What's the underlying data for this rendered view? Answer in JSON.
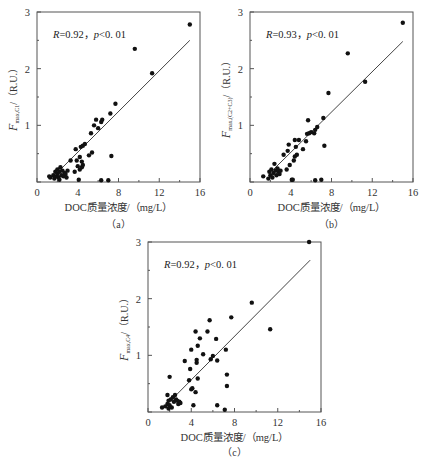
{
  "chart_data": [
    {
      "type": "scatter",
      "panel": "a",
      "caption": "（a）",
      "title": "",
      "annotation": {
        "R": "R=0.92，",
        "p": "p<0. 01"
      },
      "xlabel": "DOC质量浓度/（mg/L）",
      "ylabel": {
        "main": "F",
        "sub": "max,C1",
        "unit": "/（R.U.）"
      },
      "xlim": [
        0,
        16
      ],
      "ylim": [
        0,
        3
      ],
      "xticks": [
        0,
        4,
        8,
        12,
        16
      ],
      "yticks": [
        1,
        2,
        3
      ],
      "fit_line": {
        "x": [
          2.3,
          15.0
        ],
        "y": [
          0.22,
          2.5
        ]
      },
      "points": [
        [
          1.2,
          0.1
        ],
        [
          1.3,
          0.08
        ],
        [
          1.6,
          0.12
        ],
        [
          1.7,
          0.06
        ],
        [
          1.8,
          0.18
        ],
        [
          1.9,
          0.1
        ],
        [
          2.0,
          0.22
        ],
        [
          2.0,
          0.14
        ],
        [
          2.1,
          0.08
        ],
        [
          2.2,
          0.18
        ],
        [
          2.2,
          0.04
        ],
        [
          2.3,
          0.26
        ],
        [
          2.4,
          0.12
        ],
        [
          2.5,
          0.2
        ],
        [
          2.6,
          0.1
        ],
        [
          2.7,
          0.16
        ],
        [
          2.8,
          0.14
        ],
        [
          2.9,
          0.08
        ],
        [
          3.0,
          0.2
        ],
        [
          3.3,
          0.38
        ],
        [
          3.7,
          0.18
        ],
        [
          3.8,
          0.58
        ],
        [
          3.9,
          0.38
        ],
        [
          4.0,
          0.28
        ],
        [
          4.1,
          0.04
        ],
        [
          4.2,
          0.22
        ],
        [
          4.2,
          0.44
        ],
        [
          4.3,
          0.62
        ],
        [
          4.4,
          0.36
        ],
        [
          4.4,
          0.26
        ],
        [
          4.5,
          0.3
        ],
        [
          4.5,
          0.64
        ],
        [
          4.7,
          0.67
        ],
        [
          5.1,
          0.47
        ],
        [
          5.3,
          0.86
        ],
        [
          5.4,
          0.52
        ],
        [
          5.6,
          1.0
        ],
        [
          5.8,
          1.1
        ],
        [
          6.0,
          0.95
        ],
        [
          6.3,
          1.06
        ],
        [
          6.4,
          1.1
        ],
        [
          6.3,
          0.03
        ],
        [
          7.0,
          0.03
        ],
        [
          7.2,
          1.21
        ],
        [
          7.3,
          0.46
        ],
        [
          7.7,
          1.38
        ],
        [
          9.6,
          2.35
        ],
        [
          11.3,
          1.92
        ],
        [
          15.0,
          2.78
        ]
      ]
    },
    {
      "type": "scatter",
      "panel": "b",
      "caption": "（b）",
      "title": "",
      "annotation": {
        "R": "R=0.93，",
        "p": "p<0. 01"
      },
      "xlabel": "DOC质量浓度/（mg/L）",
      "ylabel": {
        "main": "F",
        "sub": "max,(C2+C3)",
        "unit": "/（R.U.）"
      },
      "xlim": [
        0,
        16
      ],
      "ylim": [
        0,
        3
      ],
      "xticks": [
        0,
        4,
        8,
        12,
        16
      ],
      "yticks": [
        1,
        2,
        3
      ],
      "fit_line": {
        "x": [
          2.3,
          15.0
        ],
        "y": [
          0.22,
          2.48
        ]
      },
      "points": [
        [
          1.3,
          0.1
        ],
        [
          1.8,
          0.06
        ],
        [
          1.9,
          0.18
        ],
        [
          2.0,
          0.12
        ],
        [
          2.1,
          0.22
        ],
        [
          2.2,
          0.08
        ],
        [
          2.3,
          0.16
        ],
        [
          2.4,
          0.32
        ],
        [
          2.5,
          0.2
        ],
        [
          2.6,
          0.12
        ],
        [
          2.7,
          0.24
        ],
        [
          2.8,
          0.18
        ],
        [
          2.9,
          0.14
        ],
        [
          3.0,
          0.2
        ],
        [
          3.3,
          0.48
        ],
        [
          3.6,
          0.22
        ],
        [
          3.7,
          0.55
        ],
        [
          3.8,
          0.66
        ],
        [
          3.9,
          0.3
        ],
        [
          4.1,
          0.04
        ],
        [
          4.2,
          0.04
        ],
        [
          4.3,
          0.38
        ],
        [
          4.4,
          0.45
        ],
        [
          4.4,
          0.74
        ],
        [
          4.5,
          0.62
        ],
        [
          4.6,
          0.48
        ],
        [
          4.8,
          0.74
        ],
        [
          5.2,
          0.58
        ],
        [
          5.5,
          0.72
        ],
        [
          5.6,
          0.85
        ],
        [
          5.7,
          1.09
        ],
        [
          5.8,
          0.86
        ],
        [
          6.0,
          0.88
        ],
        [
          6.3,
          0.86
        ],
        [
          6.4,
          0.92
        ],
        [
          6.6,
          0.97
        ],
        [
          6.4,
          0.03
        ],
        [
          7.0,
          0.04
        ],
        [
          7.2,
          1.13
        ],
        [
          7.3,
          0.64
        ],
        [
          7.7,
          1.57
        ],
        [
          9.6,
          2.27
        ],
        [
          11.3,
          1.77
        ],
        [
          15.0,
          2.81
        ]
      ]
    },
    {
      "type": "scatter",
      "panel": "c",
      "caption": "（c）",
      "title": "",
      "annotation": {
        "R": "R=0.92，",
        "p": "p<0. 01"
      },
      "xlabel": "DOC质量浓度/（mg/L）",
      "ylabel": {
        "main": "F",
        "sub": "max,C4",
        "unit": "/（R.U.）"
      },
      "xlim": [
        0,
        16
      ],
      "ylim": [
        0,
        3
      ],
      "xticks": [
        0,
        4,
        8,
        12,
        16
      ],
      "yticks": [
        1,
        2,
        3
      ],
      "fit_line": {
        "x": [
          2.3,
          15.0
        ],
        "y": [
          0.24,
          2.68
        ]
      },
      "points": [
        [
          1.3,
          0.08
        ],
        [
          1.6,
          0.1
        ],
        [
          1.8,
          0.3
        ],
        [
          1.8,
          0.14
        ],
        [
          1.9,
          0.06
        ],
        [
          1.9,
          0.2
        ],
        [
          2.0,
          0.62
        ],
        [
          2.0,
          0.12
        ],
        [
          2.1,
          0.22
        ],
        [
          2.2,
          0.08
        ],
        [
          2.3,
          0.26
        ],
        [
          2.4,
          0.18
        ],
        [
          2.5,
          0.3
        ],
        [
          2.6,
          0.22
        ],
        [
          2.7,
          0.2
        ],
        [
          2.8,
          0.14
        ],
        [
          2.9,
          0.18
        ],
        [
          3.0,
          0.16
        ],
        [
          3.4,
          0.9
        ],
        [
          3.8,
          0.56
        ],
        [
          3.9,
          0.76
        ],
        [
          4.0,
          1.1
        ],
        [
          4.0,
          0.4
        ],
        [
          4.1,
          0.42
        ],
        [
          4.2,
          0.12
        ],
        [
          4.4,
          1.42
        ],
        [
          4.4,
          0.35
        ],
        [
          4.5,
          0.87
        ],
        [
          4.5,
          0.92
        ],
        [
          4.6,
          1.17
        ],
        [
          4.6,
          0.59
        ],
        [
          4.8,
          1.3
        ],
        [
          5.1,
          1.02
        ],
        [
          5.5,
          1.42
        ],
        [
          5.7,
          1.62
        ],
        [
          5.8,
          0.93
        ],
        [
          6.0,
          0.99
        ],
        [
          6.3,
          1.29
        ],
        [
          6.4,
          0.91
        ],
        [
          6.4,
          0.12
        ],
        [
          7.1,
          0.04
        ],
        [
          7.2,
          1.1
        ],
        [
          7.3,
          0.46
        ],
        [
          7.3,
          0.66
        ],
        [
          7.7,
          1.67
        ],
        [
          9.6,
          1.93
        ],
        [
          11.3,
          1.46
        ],
        [
          14.9,
          3.0
        ]
      ]
    }
  ],
  "panels": [
    {
      "frame": {
        "x": 37,
        "y": 12,
        "w": 163,
        "h": 170
      }
    },
    {
      "frame": {
        "x": 250,
        "y": 12,
        "w": 163,
        "h": 170
      }
    },
    {
      "frame": {
        "x": 148,
        "y": 242,
        "w": 173,
        "h": 170
      }
    }
  ]
}
